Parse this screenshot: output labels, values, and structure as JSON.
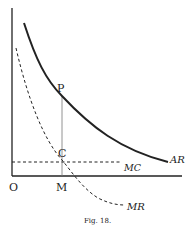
{
  "figure": {
    "caption": "Fig. 18.",
    "type": "economics-diagram"
  },
  "axes": {
    "origin_label": "O",
    "x_point_label": "M"
  },
  "points": {
    "p_label": "P",
    "c_label": "C"
  },
  "curves": {
    "ar": {
      "label": "AR",
      "style": "solid",
      "color": "#222222"
    },
    "mr": {
      "label": "MR",
      "style": "dashed",
      "color": "#222222"
    },
    "mc": {
      "label": "MC",
      "style": "dashed",
      "color": "#222222"
    }
  },
  "colors": {
    "background": "#ffffff",
    "ink": "#222222",
    "guide": "#777777"
  }
}
